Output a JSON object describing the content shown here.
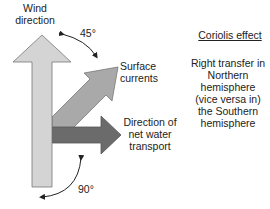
{
  "labels": {
    "wind_direction_line1": "Wind",
    "wind_direction_line2": "direction",
    "surface_currents_line1": "Surface",
    "surface_currents_line2": "currents",
    "net_transport_line1": "Direction of",
    "net_transport_line2": "net water",
    "net_transport_line3": "transport",
    "angle_wind_surface": "45°",
    "angle_wind_transport": "90°"
  },
  "coriolis": {
    "title": "Coriolis effect",
    "body_lines": [
      "Right transfer in",
      "Northern",
      "hemisphere",
      "(vice versa in)",
      "the Southern",
      "hemisphere"
    ]
  },
  "colors": {
    "wind_arrow": "#d4d4d4",
    "surface_arrow": "#a9a9a9",
    "transport_arrow": "#6b6b6b",
    "outline": "#555555",
    "angle_arc": "#222222"
  }
}
